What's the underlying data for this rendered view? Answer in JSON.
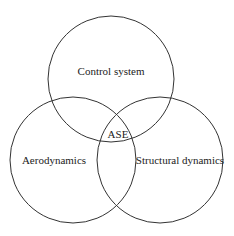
{
  "diagram": {
    "type": "venn",
    "circles": [
      {
        "label": "Control system",
        "cx": 111,
        "cy": 79,
        "r": 63
      },
      {
        "label": "Aerodynamics",
        "cx": 73,
        "cy": 160,
        "r": 63
      },
      {
        "label": "Structural dynamics",
        "cx": 160,
        "cy": 160,
        "r": 63
      }
    ],
    "intersection_label": "ASE",
    "stroke_color": "#333333",
    "background": "#ffffff"
  }
}
